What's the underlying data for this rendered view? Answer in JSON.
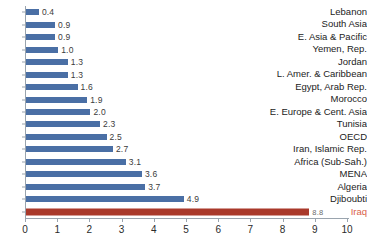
{
  "chart_data": {
    "type": "bar",
    "orientation": "horizontal",
    "title": "",
    "xlabel": "",
    "ylabel": "",
    "xlim": [
      0,
      10
    ],
    "xticks": [
      0,
      1,
      2,
      3,
      4,
      5,
      6,
      7,
      8,
      9,
      10
    ],
    "xtick_labels": [
      "0",
      "1",
      "2",
      "3",
      "4",
      "5",
      "6",
      "7",
      "8",
      "9",
      "10"
    ],
    "grid": false,
    "legend": null,
    "categories": [
      "Lebanon",
      "South Asia",
      "E. Asia & Pacific",
      "Yemen, Rep.",
      "Jordan",
      "L. Amer. & Caribbean",
      "Egypt, Arab Rep.",
      "Morocco",
      "E. Europe & Cent. Asia",
      "Tunisia",
      "OECD",
      "Iran, Islamic Rep.",
      "Africa (Sub-Sah.)",
      "MENA",
      "Algeria",
      "Djiboubti",
      "Iraq"
    ],
    "values": [
      0.4,
      0.9,
      0.9,
      1.0,
      1.3,
      1.3,
      1.6,
      1.9,
      2.0,
      2.3,
      2.5,
      2.7,
      3.1,
      3.6,
      3.7,
      4.9,
      8.8
    ],
    "value_labels": [
      "0.4",
      "0.9",
      "0.9",
      "1.0",
      "1.3",
      "1.3",
      "1.6",
      "1.9",
      "2.0",
      "2.3",
      "2.5",
      "2.7",
      "3.1",
      "3.6",
      "3.7",
      "4.9",
      "8.8"
    ],
    "highlight_index": 16,
    "colors": {
      "bar": "#4a6fa5",
      "highlight_bar": "#a9392b",
      "highlight_label": "#d9604a",
      "axis": "#9aa4ae",
      "text": "#222222",
      "value_text": "#3b3b3b",
      "background": "#ffffff"
    }
  }
}
